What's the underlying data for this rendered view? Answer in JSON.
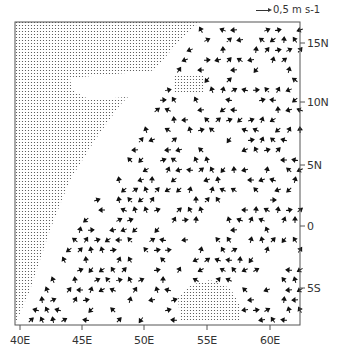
{
  "chart_data": {
    "type": "vector-field",
    "title": "",
    "legend": {
      "reference_arrow": "0,5 m s-1"
    },
    "x_ticks": [
      "40E",
      "45E",
      "50E",
      "55E",
      "60E"
    ],
    "y_ticks": [
      "15N",
      "10N",
      "5N",
      "0",
      "5S"
    ],
    "xlim": [
      39.6,
      62.5
    ],
    "ylim": [
      -7.9,
      17.2
    ],
    "grid": false,
    "shaded_regions": [
      {
        "name": "land-africa",
        "description": "stippled landmass west/upper-left"
      },
      {
        "name": "socotra-patch",
        "description": "small stippled patch near 53-55E, 11-12N"
      },
      {
        "name": "seychelles-patch",
        "description": "stippled patch near 53-58E, 6-8S"
      }
    ]
  },
  "axes": {
    "x_labels": [
      "40E",
      "45E",
      "50E",
      "55E",
      "60E"
    ],
    "y_labels": [
      "15N",
      "10N",
      "5N",
      "0",
      "5S"
    ],
    "legend_text": "0,5 m s-1"
  }
}
